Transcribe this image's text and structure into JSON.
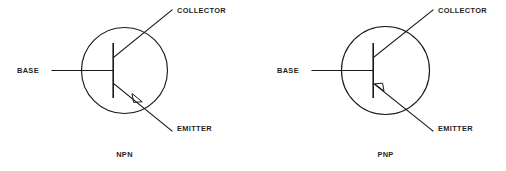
{
  "figure": {
    "background_color": "#ffffff",
    "line_color": "#1a1a1a",
    "text_color": "#1f1f1f"
  },
  "symbols": [
    {
      "id": "npn",
      "caption": "NPN",
      "terminals": {
        "base": "BASE",
        "collector": "COLLECTOR",
        "emitter": "EMITTER"
      },
      "arrow_direction": "outward",
      "arrow_on": "emitter",
      "envelope": {
        "cx": 124.5,
        "cy": 70.5,
        "r": 43
      }
    },
    {
      "id": "pnp",
      "caption": "PNP",
      "terminals": {
        "base": "BASE",
        "collector": "COLLECTOR",
        "emitter": "EMITTER"
      },
      "arrow_direction": "inward",
      "arrow_on": "emitter",
      "envelope": {
        "cx": 385.5,
        "cy": 70.5,
        "r": 44
      }
    }
  ]
}
